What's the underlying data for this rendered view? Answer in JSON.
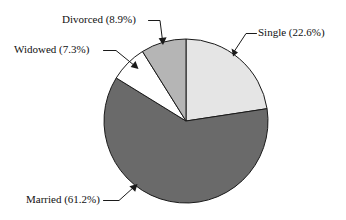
{
  "chart_data": {
    "type": "pie",
    "title": "",
    "subtitle": "",
    "xlabel": "",
    "ylabel": "",
    "legend_position": "none",
    "grid": false,
    "units": "percent",
    "start_angle_deg": 0,
    "direction": "clockwise",
    "categories": [
      "Single",
      "Married",
      "Widowed",
      "Divorced"
    ],
    "values": [
      22.6,
      61.2,
      7.3,
      8.9
    ],
    "slices": [
      {
        "name": "Single",
        "value": 22.6,
        "label": "Single (22.6%)",
        "color": "#e5e5e5",
        "label_anchor": "start",
        "label_x": 258,
        "label_y": 36
      },
      {
        "name": "Married",
        "value": 61.2,
        "label": "Married (61.2%)",
        "color": "#6a6a6a",
        "label_anchor": "start",
        "label_x": 26,
        "label_y": 203
      },
      {
        "name": "Widowed",
        "value": 7.3,
        "label": "Widowed (7.3%)",
        "color": "#ffffff",
        "label_anchor": "start",
        "label_x": 14,
        "label_y": 53
      },
      {
        "name": "Divorced",
        "value": 8.9,
        "label": "Divorced (8.9%)",
        "color": "#b5b5b5",
        "label_anchor": "start",
        "label_x": 62,
        "label_y": 23
      }
    ],
    "geometry": {
      "center_x": 186,
      "center_y": 121,
      "radius": 82
    },
    "colors": {
      "single": "#e5e5e5",
      "married": "#6a6a6a",
      "widowed": "#ffffff",
      "divorced": "#b5b5b5",
      "outline": "#1a1a1a",
      "background": "#ffffff"
    }
  }
}
